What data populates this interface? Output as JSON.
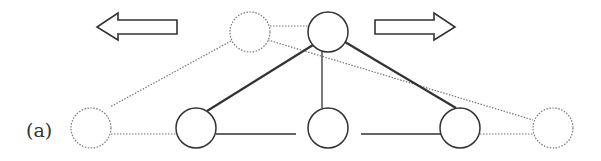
{
  "figure": {
    "panel_label": "(a)",
    "colors": {
      "stroke": "#333333",
      "dotted": "#777777",
      "background": "#ffffff"
    },
    "arrows": [
      {
        "id": "arrow-left",
        "direction": "left",
        "x1": 97,
        "x2": 177,
        "y": 27
      },
      {
        "id": "arrow-right",
        "direction": "right",
        "x1": 375,
        "x2": 455,
        "y": 27
      }
    ],
    "nodes": [
      {
        "id": "top-ghost",
        "cx": 250,
        "cy": 32,
        "r": 20,
        "style": "dotted"
      },
      {
        "id": "top",
        "cx": 328,
        "cy": 32,
        "r": 20,
        "style": "solid"
      },
      {
        "id": "bottom-ghost-left",
        "cx": 91,
        "cy": 128,
        "r": 20,
        "style": "dotted"
      },
      {
        "id": "bottom-left",
        "cx": 196,
        "cy": 128,
        "r": 20,
        "style": "solid"
      },
      {
        "id": "bottom-mid",
        "cx": 328,
        "cy": 128,
        "r": 20,
        "style": "solid"
      },
      {
        "id": "bottom-right",
        "cx": 460,
        "cy": 128,
        "r": 20,
        "style": "solid"
      },
      {
        "id": "bottom-ghost-right",
        "cx": 553,
        "cy": 128,
        "r": 20,
        "style": "dotted"
      }
    ],
    "edges": [
      {
        "from": "top",
        "to": "bottom-left",
        "style": "thick"
      },
      {
        "from": "top",
        "to": "bottom-right",
        "style": "thick"
      },
      {
        "from": "top",
        "to": "bottom-mid",
        "style": "thin"
      },
      {
        "from": "bottom-left",
        "to": "bottom-mid",
        "style": "thin-gap"
      },
      {
        "from": "bottom-mid",
        "to": "bottom-right",
        "style": "thin-gap"
      },
      {
        "from": "top-ghost",
        "to": "top",
        "style": "dotted"
      },
      {
        "from": "top-ghost",
        "to": "bottom-ghost-left",
        "style": "dotted"
      },
      {
        "from": "top-ghost",
        "to": "bottom-ghost-right",
        "style": "dotted"
      },
      {
        "from": "bottom-ghost-left",
        "to": "bottom-left",
        "style": "dotted"
      },
      {
        "from": "bottom-right",
        "to": "bottom-ghost-right",
        "style": "dotted"
      }
    ]
  }
}
